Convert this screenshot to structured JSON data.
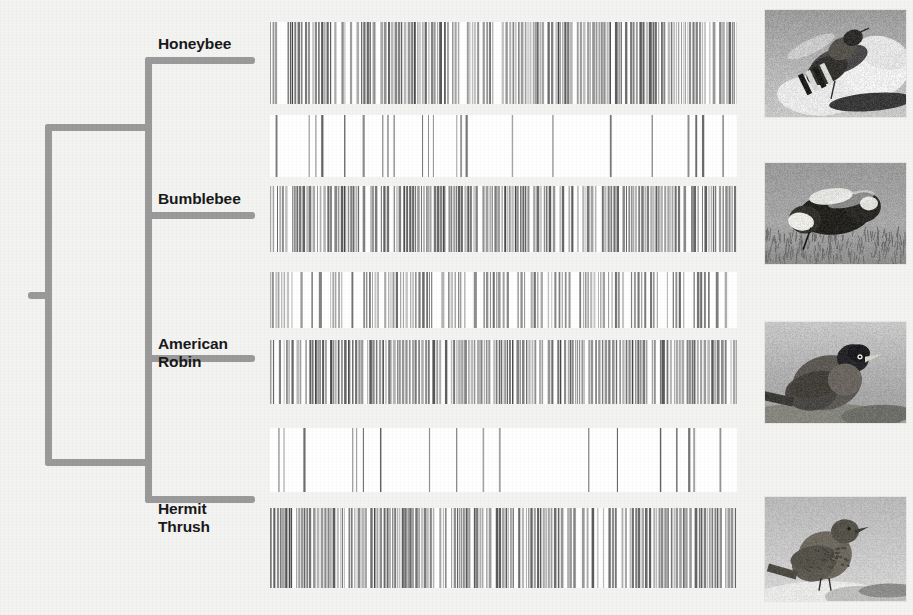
{
  "figure": {
    "background_color": "#f3f3f1",
    "branch_color": "#9a9a9a",
    "label_color": "#19191b",
    "track_background": "#ffffff"
  },
  "taxa": [
    {
      "id": "honeybee",
      "label": "Honeybee",
      "label_x": 158,
      "label_y": 35,
      "photo_alt": "honeybee on white flower"
    },
    {
      "id": "bumblebee",
      "label": "Bumblebee",
      "label_x": 158,
      "label_y": 190,
      "photo_alt": "bumblebee on grass"
    },
    {
      "id": "american-robin",
      "label": "American\nRobin",
      "label_x": 158,
      "label_y": 335,
      "photo_alt": "american robin perched on rock"
    },
    {
      "id": "hermit-thrush",
      "label": "Hermit\nThrush",
      "label_x": 158,
      "label_y": 500,
      "photo_alt": "hermit thrush perched on snowy rock"
    }
  ],
  "tree": {
    "root_stub": {
      "x": 28,
      "y": 292,
      "w": 20,
      "h": 7
    },
    "spine_outer": {
      "x": 45,
      "y": 124,
      "w": 7,
      "h": 342
    },
    "upper_connector": {
      "x": 45,
      "y": 124,
      "w": 104,
      "h": 7
    },
    "lower_connector": {
      "x": 45,
      "y": 459,
      "w": 104,
      "h": 7
    },
    "bee_spine": {
      "x": 145,
      "y": 57,
      "w": 7,
      "h": 421
    },
    "honeybee_branch": {
      "x": 145,
      "y": 57,
      "w": 110,
      "h": 7
    },
    "bumblebee_branch": {
      "x": 145,
      "y": 212,
      "w": 110,
      "h": 7
    },
    "bird_spine": {
      "x": 145,
      "y": 355,
      "w": 7,
      "h": 148
    },
    "robin_branch": {
      "x": 145,
      "y": 355,
      "w": 110,
      "h": 7
    },
    "thrush_branch": {
      "x": 145,
      "y": 496,
      "w": 110,
      "h": 7
    }
  },
  "tracks": [
    {
      "id": "track-1",
      "name": "honeybee-genome-track-a",
      "top": 22,
      "height": 82,
      "density": "very-dense",
      "seed": 1071,
      "bar_count": 300,
      "min_gray": 88,
      "max_gray": 196
    },
    {
      "id": "track-2",
      "name": "honeybee-genome-track-b",
      "top": 115,
      "height": 62,
      "density": "sparse",
      "seed": 2244,
      "bar_count": 34,
      "min_gray": 96,
      "max_gray": 168
    },
    {
      "id": "track-3",
      "name": "bumblebee-genome-track",
      "top": 186,
      "height": 66,
      "density": "very-dense",
      "seed": 3319,
      "bar_count": 290,
      "min_gray": 92,
      "max_gray": 194
    },
    {
      "id": "track-4",
      "name": "bumblebee-genome-track-b",
      "top": 272,
      "height": 56,
      "density": "dense",
      "seed": 4188,
      "bar_count": 150,
      "min_gray": 104,
      "max_gray": 198
    },
    {
      "id": "track-5",
      "name": "robin-genome-track",
      "top": 340,
      "height": 64,
      "density": "very-dense",
      "seed": 5123,
      "bar_count": 285,
      "min_gray": 86,
      "max_gray": 192
    },
    {
      "id": "track-6",
      "name": "robin-genome-track-b",
      "top": 428,
      "height": 64,
      "density": "sparse",
      "seed": 6077,
      "bar_count": 38,
      "min_gray": 100,
      "max_gray": 170
    },
    {
      "id": "track-7",
      "name": "thrush-genome-track",
      "top": 508,
      "height": 80,
      "density": "very-dense",
      "seed": 7341,
      "bar_count": 300,
      "min_gray": 88,
      "max_gray": 194
    }
  ],
  "photos": [
    {
      "id": "photo-honeybee",
      "top": 10,
      "height": 107,
      "scene": "bee"
    },
    {
      "id": "photo-bumblebee",
      "top": 163,
      "height": 101,
      "scene": "bumblebee"
    },
    {
      "id": "photo-robin",
      "top": 322,
      "height": 101,
      "scene": "robin"
    },
    {
      "id": "photo-thrush",
      "top": 497,
      "height": 104,
      "scene": "thrush"
    }
  ]
}
